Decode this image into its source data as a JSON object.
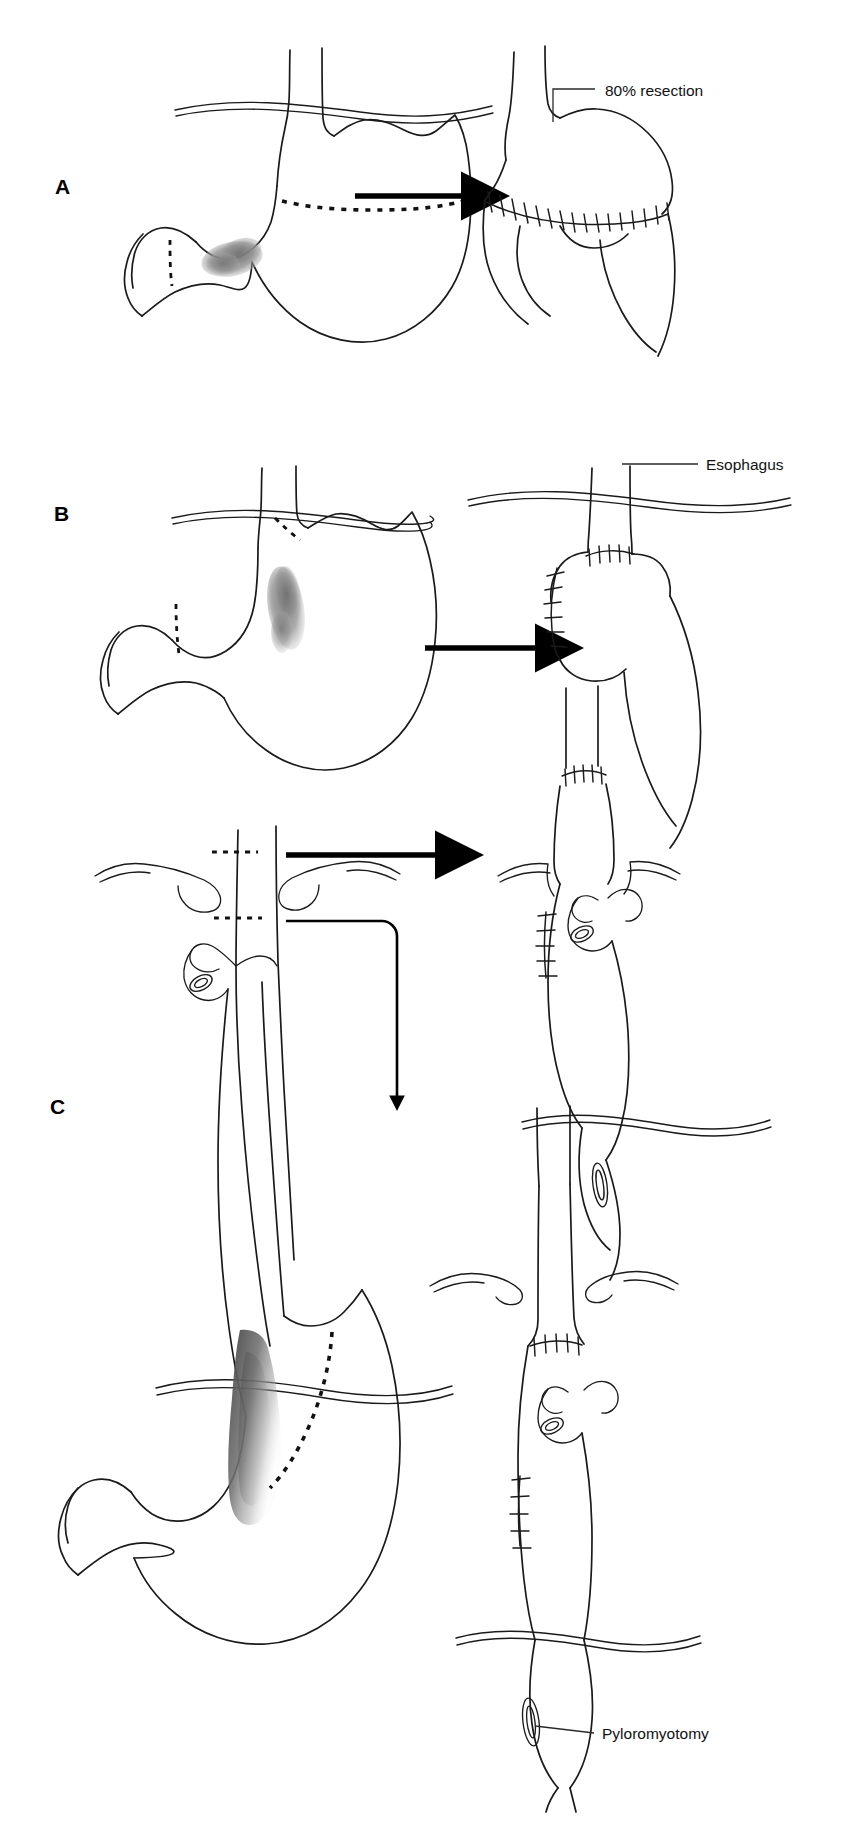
{
  "figure": {
    "background_color": "#ffffff",
    "ink_color": "#1a1a1a",
    "width": 854,
    "height": 1836
  },
  "panels": [
    {
      "id": "A",
      "letter": "A",
      "letter_x": 55,
      "letter_y": 194,
      "description": "Subtotal gastrectomy for distal gastric tumor with gastroduodenal anastomosis",
      "before": {
        "name": "stomach-with-distal-tumor",
        "tumor_location": "distal stomach / antrum",
        "resection_lines": [
          "transverse upper body dashed line",
          "duodenal dashed line"
        ]
      },
      "after": {
        "name": "post-resection-stomach-remnant",
        "anastomosis": "sutured anastomosis"
      },
      "callouts": [
        {
          "id": "resection-percent",
          "label": "80% resection",
          "text_x": 605,
          "text_y": 96,
          "leader_from_x": 553,
          "leader_from_y": 122,
          "leader_to_x": 595,
          "leader_to_y": 89
        }
      ],
      "arrow": {
        "name": "transform-arrow-a",
        "from_x": 355,
        "from_y": 196,
        "to_x": 480,
        "to_y": 196,
        "style": "thick-solid"
      }
    },
    {
      "id": "B",
      "letter": "B",
      "letter_x": 54,
      "letter_y": 521,
      "description": "Proximal gastrectomy with esophagogastrostomy for proximal gastric tumor",
      "before": {
        "name": "stomach-with-proximal-tumor",
        "tumor_location": "proximal stomach / cardia",
        "resection_lines": [
          "cardia dashed line",
          "duodenal dashed line"
        ]
      },
      "after": {
        "name": "post-proximal-gastrectomy-remnant",
        "anastomosis": "esophagogastric anastomosis"
      },
      "callouts": [
        {
          "id": "esophagus-label",
          "label": "Esophagus",
          "text_x": 706,
          "text_y": 470,
          "leader_from_x": 622,
          "leader_from_y": 464,
          "leader_to_x": 698,
          "leader_to_y": 464
        }
      ],
      "arrow": {
        "name": "transform-arrow-b",
        "from_x": 345,
        "from_y": 547,
        "to_x": 470,
        "to_y": 547,
        "style": "thick-solid"
      }
    },
    {
      "id": "C",
      "letter": "C",
      "letter_x": 50,
      "letter_y": 1114,
      "description": "Total gastrectomy or esophagogastrectomy with gastric pull-up conduit, cervical or intrathoracic anastomosis, and pyloromyotomy",
      "before": {
        "name": "esophagus-stomach-with-ge-junction-tumor",
        "tumor_location": "gastroesophageal junction / distal esophagus",
        "resection_lines": [
          "upper cervical esophagus dashed line",
          "lower thoracic esophagus dashed line",
          "proximal stomach dashed line"
        ]
      },
      "after_upper": {
        "name": "cervical-anastomosis-conduit",
        "anastomosis": "cervical esophagogastric anastomosis"
      },
      "after_lower": {
        "name": "intrathoracic-anastomosis-conduit",
        "anastomosis": "intrathoracic esophagogastric anastomosis"
      },
      "callouts": [
        {
          "id": "pyloromyotomy-label",
          "label": "Pyloromyotomy",
          "text_x": 602,
          "text_y": 1738,
          "leader_from_x": 533,
          "leader_from_y": 1725,
          "leader_to_x": 594,
          "leader_to_y": 1733
        }
      ],
      "arrows": [
        {
          "name": "transform-arrow-c-upper",
          "from_x": 212,
          "from_y": 855,
          "to_x": 452,
          "to_y": 855,
          "style": "thick-solid"
        },
        {
          "name": "transform-arrow-c-lower",
          "from_x": 238,
          "from_y": 920,
          "to_x": 397,
          "to_y": 1112,
          "style": "thin-elbow-down"
        }
      ]
    }
  ],
  "labels": {
    "resection_percent": "80% resection",
    "esophagus": "Esophagus",
    "pyloromyotomy": "Pyloromyotomy",
    "panel_a": "A",
    "panel_b": "B",
    "panel_c": "C"
  },
  "colors": {
    "ink": "#1a1a1a",
    "tumor_shade": "#8a8a8a",
    "background": "#ffffff",
    "arrow": "#000000"
  }
}
